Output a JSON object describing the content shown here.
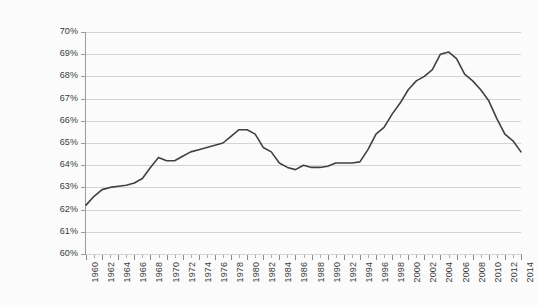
{
  "chart_data": {
    "type": "line",
    "title": "",
    "subtitle": "",
    "xlabel": "",
    "ylabel": "",
    "xlim": [
      1960,
      2014
    ],
    "ylim": [
      60,
      70
    ],
    "ytick_step": 1,
    "xtick_step": 2,
    "grid": true,
    "grid_axis": "y",
    "legend": false,
    "legend_position": "none",
    "line_color": "#404040",
    "line_width": 1.6,
    "markers": false,
    "background_color": "#fbfbfb",
    "gridline_color": "#d4d4d4",
    "axis_color": "#9a9a9a",
    "ytick_labels": [
      "70%",
      "69%",
      "68%",
      "67%",
      "66%",
      "65%",
      "64%",
      "63%",
      "62%",
      "61%",
      "60%"
    ],
    "ytick_values": [
      70,
      69,
      68,
      67,
      66,
      65,
      64,
      63,
      62,
      61,
      60
    ],
    "xtick_labels": [
      "1960",
      "1962",
      "1964",
      "1966",
      "1968",
      "1970",
      "1972",
      "1974",
      "1976",
      "1978",
      "1980",
      "1982",
      "1984",
      "1986",
      "1988",
      "1990",
      "1992",
      "1994",
      "1996",
      "1998",
      "2000",
      "2002",
      "2004",
      "2006",
      "2008",
      "2010",
      "2012",
      "2014"
    ],
    "x": [
      1960,
      1961,
      1962,
      1963,
      1964,
      1965,
      1966,
      1967,
      1968,
      1969,
      1970,
      1971,
      1972,
      1973,
      1974,
      1975,
      1976,
      1977,
      1978,
      1979,
      1980,
      1981,
      1982,
      1983,
      1984,
      1985,
      1986,
      1987,
      1988,
      1989,
      1990,
      1991,
      1992,
      1993,
      1994,
      1995,
      1996,
      1997,
      1998,
      1999,
      2000,
      2001,
      2002,
      2003,
      2004,
      2005,
      2006,
      2007,
      2008,
      2009,
      2010,
      2011,
      2012,
      2013,
      2014
    ],
    "values": [
      62.2,
      62.6,
      62.9,
      63.0,
      63.05,
      63.1,
      63.2,
      63.4,
      63.9,
      64.35,
      64.2,
      64.2,
      64.4,
      64.6,
      64.7,
      64.8,
      64.9,
      65.0,
      65.3,
      65.6,
      65.6,
      65.4,
      64.8,
      64.6,
      64.1,
      63.9,
      63.8,
      64.0,
      63.9,
      63.9,
      63.95,
      64.1,
      64.1,
      64.1,
      64.15,
      64.7,
      65.4,
      65.7,
      66.3,
      66.8,
      67.4,
      67.8,
      68.0,
      68.3,
      69.0,
      69.1,
      68.8,
      68.1,
      67.8,
      67.4,
      66.9,
      66.1,
      65.4,
      65.1,
      64.6
    ],
    "annotations": []
  }
}
